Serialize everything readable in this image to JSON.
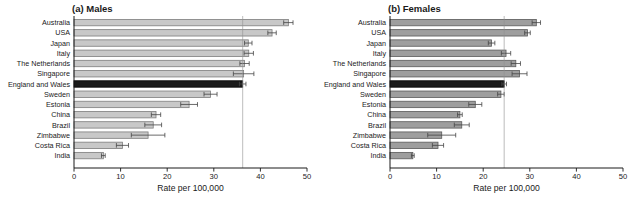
{
  "figure": {
    "colors": {
      "highlight_fill": "#1b1b1b",
      "highlight_stroke": "#000000",
      "refline": "#909090",
      "axis": "#1a1a1a",
      "error_bar": "#454545",
      "text": "#1a1a1a"
    }
  },
  "chart_data": [
    {
      "type": "bar",
      "orientation": "horizontal",
      "title": "(a) Males",
      "xlabel": "Rate per 100,000",
      "xlim": [
        0,
        50
      ],
      "ticks": [
        0,
        10,
        20,
        30,
        40,
        50
      ],
      "grid": false,
      "legend": "none",
      "bar_fill": "#c8c8c8",
      "bar_stroke": "#7d7d7d",
      "highlight": "England and Wales",
      "reference_line": 36.2,
      "categories": [
        "Australia",
        "USA",
        "Japan",
        "Italy",
        "The Netherlands",
        "Singapore",
        "England and Wales",
        "Sweden",
        "Estonia",
        "China",
        "Brazil",
        "Zimbabwe",
        "Costa Rica",
        "India"
      ],
      "values": [
        46.0,
        42.5,
        37.4,
        37.5,
        36.6,
        36.4,
        36.2,
        29.3,
        24.7,
        17.6,
        17.0,
        15.9,
        10.4,
        6.3
      ],
      "errors": [
        1.0,
        0.9,
        0.8,
        1.0,
        1.0,
        2.2,
        0.7,
        1.4,
        1.8,
        1.0,
        1.8,
        3.6,
        1.3,
        0.4
      ]
    },
    {
      "type": "bar",
      "orientation": "horizontal",
      "title": "(b) Females",
      "xlabel": "Rate per 100,000",
      "xlim": [
        0,
        50
      ],
      "ticks": [
        0,
        10,
        20,
        30,
        40,
        50
      ],
      "grid": false,
      "legend": "none",
      "bar_fill": "#9e9e9e",
      "bar_stroke": "#5a5a5a",
      "highlight": "England and Wales",
      "reference_line": 24.5,
      "categories": [
        "Australia",
        "USA",
        "Japan",
        "Italy",
        "The Netherlands",
        "Singapore",
        "England and Wales",
        "Sweden",
        "Estonia",
        "China",
        "Brazil",
        "Zimbabwe",
        "Costa Rica",
        "India"
      ],
      "values": [
        31.4,
        29.5,
        21.8,
        24.9,
        27.0,
        27.8,
        24.5,
        23.8,
        18.3,
        15.0,
        15.4,
        11.1,
        10.3,
        4.9
      ],
      "errors": [
        0.9,
        0.6,
        0.7,
        1.0,
        1.0,
        1.6,
        0.5,
        0.7,
        1.4,
        0.5,
        1.6,
        3.0,
        1.2,
        0.3
      ]
    }
  ]
}
